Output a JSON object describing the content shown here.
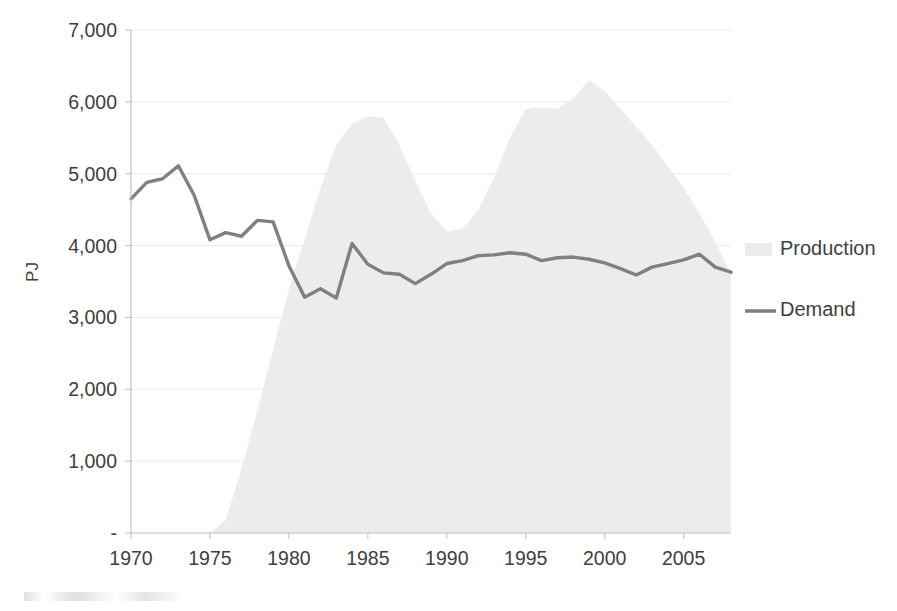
{
  "chart_data": {
    "type": "area",
    "title": "",
    "xlabel": "",
    "ylabel": "PJ",
    "xlim": [
      1970,
      2008
    ],
    "ylim": [
      0,
      7000
    ],
    "grid": true,
    "legend_position": "right",
    "x_tick_labels": [
      "1970",
      "1975",
      "1980",
      "1985",
      "1990",
      "1995",
      "2000",
      "2005"
    ],
    "x_ticks": [
      1970,
      1975,
      1980,
      1985,
      1990,
      1995,
      2000,
      2005
    ],
    "y_tick_labels": [
      "-",
      "1,000",
      "2,000",
      "3,000",
      "4,000",
      "5,000",
      "6,000",
      "7,000"
    ],
    "y_ticks": [
      0,
      1000,
      2000,
      3000,
      4000,
      5000,
      6000,
      7000
    ],
    "x": [
      1970,
      1971,
      1972,
      1973,
      1974,
      1975,
      1976,
      1977,
      1978,
      1979,
      1980,
      1981,
      1982,
      1983,
      1984,
      1985,
      1986,
      1987,
      1988,
      1989,
      1990,
      1991,
      1992,
      1993,
      1994,
      1995,
      1996,
      1997,
      1998,
      1999,
      2000,
      2001,
      2002,
      2003,
      2004,
      2005,
      2006,
      2007,
      2008
    ],
    "series": [
      {
        "name": "Production",
        "type": "area",
        "color": "#ececec",
        "values": [
          0,
          0,
          0,
          0,
          0,
          0,
          180,
          900,
          1700,
          2550,
          3400,
          4100,
          4800,
          5400,
          5700,
          5800,
          5780,
          5400,
          4900,
          4450,
          4200,
          4230,
          4500,
          4950,
          5500,
          5900,
          5920,
          5900,
          6050,
          6300,
          6150,
          5900,
          5650,
          5400,
          5100,
          4800,
          4450,
          4050,
          3600
        ]
      },
      {
        "name": "Demand",
        "type": "line",
        "color": "#808080",
        "values": [
          4650,
          4880,
          4930,
          5110,
          4700,
          4080,
          4180,
          4130,
          4350,
          4330,
          3720,
          3280,
          3400,
          3270,
          4030,
          3740,
          3620,
          3600,
          3470,
          3600,
          3750,
          3790,
          3860,
          3870,
          3900,
          3880,
          3790,
          3830,
          3840,
          3810,
          3760,
          3680,
          3590,
          3700,
          3750,
          3800,
          3880,
          3700,
          3630
        ]
      }
    ]
  },
  "legend": {
    "items": [
      {
        "label": "Production",
        "marker": "area-swatch",
        "color": "#ebebeb"
      },
      {
        "label": "Demand",
        "marker": "line-swatch",
        "color": "#808080"
      }
    ]
  },
  "axis": {
    "y_title": "PJ"
  }
}
